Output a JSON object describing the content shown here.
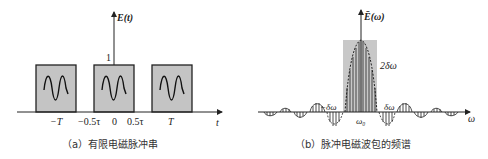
{
  "panel_a": {
    "y_axis_label": "E(t)",
    "amplitude_label": "1",
    "x_axis_label": "t",
    "ticks": [
      "−T",
      "−0.5τ",
      "0",
      "0.5τ",
      "T"
    ],
    "caption": "（a）有限电磁脉冲串",
    "pulses": [
      {
        "center": "-T",
        "shape": "gray box with sinusoid"
      },
      {
        "center": "0",
        "shape": "gray box with sinusoid"
      },
      {
        "center": "T",
        "shape": "gray box with sinusoid"
      }
    ]
  },
  "panel_b": {
    "y_axis_label": "Ē(ω)",
    "x_axis_label": "ω",
    "center_label": "ω₀",
    "width_label": "2δω",
    "left_label": "−δω",
    "right_label": "δω",
    "caption": "（b）脉冲电磁波包的频谱"
  },
  "colors": {
    "box_fill": "#c4c4c4",
    "line": "#222222",
    "shade": "#c8c8c8"
  }
}
